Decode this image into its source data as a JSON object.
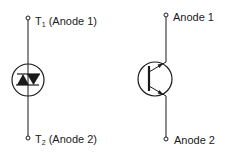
{
  "figure": {
    "left_symbol": {
      "name": "bidirectional thyristor symbol",
      "top_terminal": {
        "main": "T",
        "sub": "1",
        "suffix": " (Anode 1)"
      },
      "bottom_terminal": {
        "main": "T",
        "sub": "2",
        "suffix": " (Anode 2)"
      }
    },
    "right_symbol": {
      "name": "bidirectional transistor symbol",
      "top_terminal": {
        "label": "Anode 1"
      },
      "bottom_terminal": {
        "label": "Anode 2"
      }
    },
    "colors": {
      "line": "#1a1a1a",
      "background": "#ffffff"
    }
  }
}
